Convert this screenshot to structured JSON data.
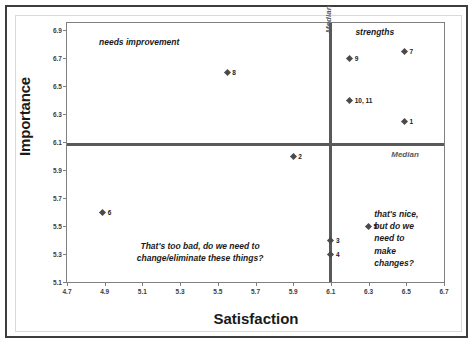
{
  "figure": {
    "x_axis_title": "Satisfaction",
    "y_axis_title": "Importance"
  },
  "annotations": {
    "needs_improvement": "needs improvement",
    "strengths": "strengths",
    "bottom_left": "That's too bad, do we need to\nchange/eliminate these things?",
    "bottom_right": "that's nice,\nbut do we\nneed to\nmake\nchanges?",
    "median_horizontal": "Median",
    "median_vertical": "Median"
  },
  "chart_data": {
    "type": "scatter",
    "title": "",
    "xlabel": "Satisfaction",
    "ylabel": "Importance",
    "xlim": [
      4.7,
      6.7
    ],
    "ylim": [
      5.1,
      6.95
    ],
    "grid": false,
    "legend": false,
    "xticks": [
      "4.7",
      "4.9",
      "5.1",
      "5.3",
      "5.5",
      "5.7",
      "5.9",
      "6.1",
      "6.3",
      "6.5",
      "6.7"
    ],
    "yticks": [
      "5.1",
      "5.3",
      "5.5",
      "5.7",
      "5.9",
      "6.1",
      "6.3",
      "6.5",
      "6.7",
      "6.9"
    ],
    "xtick_values": [
      4.7,
      4.9,
      5.1,
      5.3,
      5.5,
      5.7,
      5.9,
      6.1,
      6.3,
      6.5,
      6.7
    ],
    "ytick_values": [
      5.1,
      5.3,
      5.5,
      5.7,
      5.9,
      6.1,
      6.3,
      6.5,
      6.7,
      6.9
    ],
    "median_x": 6.1,
    "median_y": 6.08,
    "points": [
      {
        "label": "7",
        "x": 6.49,
        "y": 6.75
      },
      {
        "label": "9",
        "x": 6.2,
        "y": 6.7
      },
      {
        "label": "8",
        "x": 5.55,
        "y": 6.6
      },
      {
        "label": "10, 11",
        "x": 6.2,
        "y": 6.4
      },
      {
        "label": "1",
        "x": 6.49,
        "y": 6.25
      },
      {
        "label": "2",
        "x": 5.9,
        "y": 6.0
      },
      {
        "label": "6",
        "x": 4.89,
        "y": 5.6
      },
      {
        "label": "5",
        "x": 6.3,
        "y": 5.5
      },
      {
        "label": "3",
        "x": 6.1,
        "y": 5.4
      },
      {
        "label": "4",
        "x": 6.1,
        "y": 5.3
      }
    ]
  }
}
